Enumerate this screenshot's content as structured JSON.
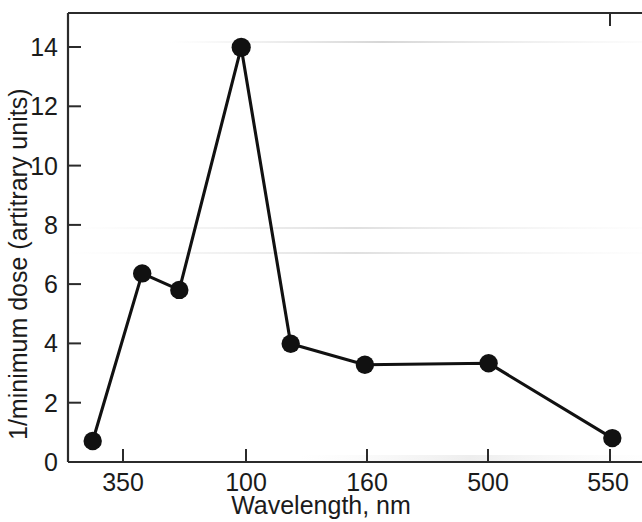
{
  "chart_data": {
    "type": "line",
    "title": "",
    "xlabel": "Wavelength, nm",
    "ylabel": "1/minimum dose (artitrary units)",
    "x": [
      340,
      360,
      375,
      400,
      420,
      450,
      500,
      550
    ],
    "values": [
      0.7,
      6.3,
      5.75,
      13.85,
      3.95,
      3.25,
      3.3,
      0.8
    ],
    "series": [
      {
        "name": "1/minimum dose",
        "values": [
          0.7,
          6.3,
          5.75,
          13.85,
          3.95,
          3.25,
          3.3,
          0.8
        ]
      }
    ],
    "xlim": [
      330,
      562
    ],
    "ylim": [
      0,
      15.0
    ],
    "xticks": [
      350,
      400,
      450,
      500,
      550
    ],
    "xtick_labels": [
      "350",
      "100",
      "160",
      "500",
      "550"
    ],
    "yticks": [
      0,
      2,
      4,
      6,
      8,
      10,
      12,
      14
    ],
    "ytick_labels": [
      "0",
      "2",
      "4",
      "6",
      "8",
      "10",
      "12",
      "14"
    ],
    "grid": false,
    "legend": "none",
    "marker": "filled-circle",
    "line_color": "#111111",
    "marker_color": "#111111"
  },
  "axes": {
    "x_title": "Wavelength, nm",
    "y_title": "1/minimum dose (artitrary units)",
    "x_tick_labels": [
      "350",
      "100",
      "160",
      "500",
      "550"
    ],
    "y_tick_labels": [
      "0",
      "2",
      "4",
      "6",
      "8",
      "10",
      "12",
      "14"
    ]
  }
}
